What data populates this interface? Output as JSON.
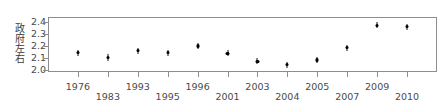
{
  "chart_data": {
    "type": "scatter",
    "title": "",
    "subtitle": "",
    "xlabel": "",
    "ylabel": "政府左右",
    "categories": [
      "1976",
      "1983",
      "1993",
      "1995",
      "1996",
      "2001",
      "2003",
      "2004",
      "2005",
      "2007",
      "2009",
      "2010"
    ],
    "values": [
      2.145,
      2.105,
      2.16,
      2.145,
      2.2,
      2.14,
      2.075,
      2.045,
      2.085,
      2.185,
      2.37,
      2.36
    ],
    "error_low": [
      2.12,
      2.08,
      2.14,
      2.12,
      2.18,
      2.115,
      2.05,
      2.025,
      2.06,
      2.16,
      2.35,
      2.34
    ],
    "error_high": [
      2.17,
      2.13,
      2.18,
      2.17,
      2.22,
      2.165,
      2.1,
      2.065,
      2.11,
      2.21,
      2.39,
      2.38
    ],
    "ylim": [
      1.985,
      2.44
    ],
    "xlim": [
      0,
      13
    ],
    "ytick_labels": [
      "2.4",
      "2.3",
      "2.2",
      "2.1",
      "2.0"
    ],
    "ytick_values": [
      2.4,
      2.3,
      2.2,
      2.1,
      2.0
    ],
    "grid": false,
    "legend": null,
    "legend_position": "none",
    "marker": "point-with-error-bar",
    "series_name": "政府左右",
    "point_color": "#000000",
    "axis_color": "#8d8d8d",
    "text_color": "#4a4a4a",
    "background_color": "#ffffff"
  }
}
